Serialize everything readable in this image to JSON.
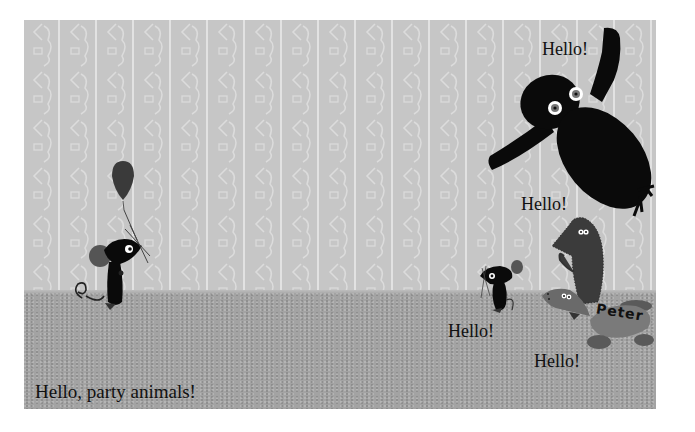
{
  "scene": {
    "caption": "Hello, party animals!",
    "greetings": {
      "owl": "Hello!",
      "hedgehog": "Hello!",
      "small_mouse": "Hello!",
      "tortoise": "Hello!"
    },
    "tortoise_shell_label": "Peter"
  },
  "colors": {
    "wall": "#c6c6c6",
    "wall_stripe": "#e2e2e2",
    "floor": "#a3a3a3",
    "ink": "#0a0a0a",
    "balloon": "#3a3a3a",
    "ears": "#555555",
    "hedgehog": "#3b3b3b",
    "tortoise": "#6e6e6e",
    "text": "#111111"
  }
}
